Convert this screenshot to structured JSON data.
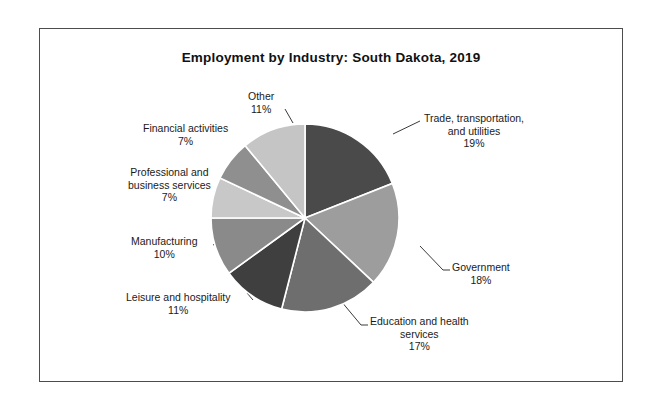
{
  "chart_data": {
    "type": "pie",
    "title": "Employment by Industry: South Dakota, 2019",
    "xlabel": "",
    "ylabel": "",
    "legend": "none",
    "grid": false,
    "categories": [
      "Trade, transportation, and utilities",
      "Government",
      "Education and health services",
      "Leisure and hospitality",
      "Manufacturing",
      "Professional and business services",
      "Financial activities",
      "Other"
    ],
    "values": [
      19,
      18,
      17,
      11,
      10,
      7,
      7,
      11
    ],
    "value_unit": "percent",
    "start_angle_deg": 0,
    "direction": "clockwise",
    "slice_colors": [
      "#4a4a4a",
      "#9d9d9d",
      "#6e6e6e",
      "#3f3f3f",
      "#8a8a8a",
      "#c8c8c8",
      "#8f8f8f",
      "#c5c5c5"
    ],
    "slice_border_color": "#ffffff"
  },
  "labels": {
    "trade": {
      "line1": "Trade, transportation,",
      "line2": "and utilities",
      "value": "19%"
    },
    "government": {
      "line1": "Government",
      "value": "18%"
    },
    "education": {
      "line1": "Education and health",
      "line2": "services",
      "value": "17%"
    },
    "leisure": {
      "line1": "Leisure and hospitality",
      "value": "11%"
    },
    "manufacturing": {
      "line1": "Manufacturing",
      "value": "10%"
    },
    "professional": {
      "line1": "Professional and",
      "line2": "business services",
      "value": "7%"
    },
    "financial": {
      "line1": "Financial activities",
      "value": "7%"
    },
    "other": {
      "line1": "Other",
      "value": "11%"
    }
  }
}
